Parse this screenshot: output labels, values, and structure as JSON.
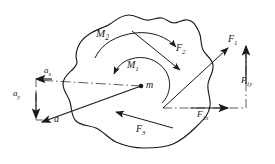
{
  "figure": {
    "kind": "free-body-diagram",
    "stroke_color": "#1a1a1a",
    "fill_color": "#ffffff",
    "width": 275,
    "height": 164
  },
  "labels": {
    "moment_2": {
      "base": "M",
      "sub": "2"
    },
    "moment_1": {
      "base": "M",
      "sub": "1"
    },
    "force_2": {
      "base": "F",
      "sub": "2"
    },
    "force_1": {
      "base": "F",
      "sub": "1"
    },
    "force_3": {
      "base": "F",
      "sub": "3"
    },
    "force_1x": {
      "base": "F",
      "sub": "1x"
    },
    "force_1y": {
      "base": "F",
      "sub": "1y"
    },
    "accel_x": {
      "base": "a",
      "sub": "x"
    },
    "accel_y": {
      "base": "a",
      "sub": "y"
    },
    "accel": {
      "base": "a",
      "sub": ""
    },
    "mass_center": {
      "base": "m",
      "sub": ""
    }
  }
}
